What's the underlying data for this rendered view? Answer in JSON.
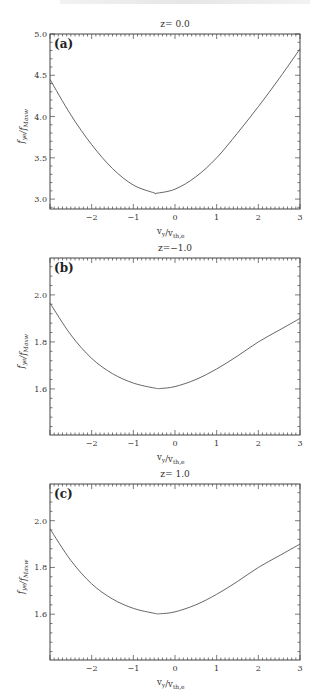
{
  "chart_data": [
    {
      "type": "line",
      "panel_label": "(a)",
      "title": "z= 0.0",
      "xlabel": "v_y/v_th,e",
      "ylabel": "f_ye/f_Maxw",
      "xlim": [
        -3,
        3
      ],
      "ylim": [
        2.88,
        5.0
      ],
      "xticks": [
        -2,
        -1,
        0,
        1,
        2,
        3
      ],
      "xtick_labels": [
        "−2",
        "−1",
        "0",
        "1",
        "2",
        "3"
      ],
      "yticks": [
        3.0,
        3.5,
        4.0,
        4.5,
        5.0
      ],
      "ytick_labels": [
        "3.0",
        "3.5",
        "4.0",
        "4.5",
        "5.0"
      ],
      "grid": false,
      "x": [
        -3.0,
        -2.5,
        -2.0,
        -1.5,
        -1.0,
        -0.5,
        -0.45,
        0.0,
        0.5,
        1.0,
        1.5,
        2.0,
        2.5,
        3.0
      ],
      "series": [
        {
          "name": "f_ye/f_Maxw",
          "values": [
            4.45,
            4.02,
            3.66,
            3.37,
            3.17,
            3.075,
            3.07,
            3.12,
            3.27,
            3.5,
            3.8,
            4.12,
            4.46,
            4.82
          ]
        }
      ]
    },
    {
      "type": "line",
      "panel_label": "(b)",
      "title": "z=−1.0",
      "xlabel": "v_y/v_th,e",
      "ylabel": "f_ye/f_Maxw",
      "xlim": [
        -3,
        3
      ],
      "ylim": [
        1.404,
        2.157
      ],
      "xticks": [
        -2,
        -1,
        0,
        1,
        2,
        3
      ],
      "xtick_labels": [
        "−2",
        "−1",
        "0",
        "1",
        "2",
        "3"
      ],
      "yticks": [
        1.6,
        1.8,
        2.0
      ],
      "ytick_labels": [
        "1.6",
        "1.8",
        "2.0"
      ],
      "grid": false,
      "x": [
        -3.0,
        -2.5,
        -2.0,
        -1.5,
        -1.0,
        -0.5,
        -0.35,
        0.0,
        0.5,
        1.0,
        1.5,
        2.0,
        2.5,
        3.0
      ],
      "series": [
        {
          "name": "f_ye/f_Maxw",
          "values": [
            1.965,
            1.83,
            1.73,
            1.665,
            1.625,
            1.604,
            1.602,
            1.61,
            1.64,
            1.685,
            1.74,
            1.8,
            1.85,
            1.9
          ]
        }
      ]
    },
    {
      "type": "line",
      "panel_label": "(c)",
      "title": "z= 1.0",
      "xlabel": "v_y/v_th,e",
      "ylabel": "f_ye/f_Maxw",
      "xlim": [
        -3,
        3
      ],
      "ylim": [
        1.404,
        2.157
      ],
      "xticks": [
        -2,
        -1,
        0,
        1,
        2,
        3
      ],
      "xtick_labels": [
        "−2",
        "−1",
        "0",
        "1",
        "2",
        "3"
      ],
      "yticks": [
        1.6,
        1.8,
        2.0
      ],
      "ytick_labels": [
        "1.6",
        "1.8",
        "2.0"
      ],
      "grid": false,
      "x": [
        -3.0,
        -2.5,
        -2.0,
        -1.5,
        -1.0,
        -0.5,
        -0.35,
        0.0,
        0.5,
        1.0,
        1.5,
        2.0,
        2.5,
        3.0
      ],
      "series": [
        {
          "name": "f_ye/f_Maxw",
          "values": [
            1.965,
            1.83,
            1.73,
            1.665,
            1.625,
            1.604,
            1.602,
            1.61,
            1.64,
            1.685,
            1.74,
            1.8,
            1.85,
            1.9
          ]
        }
      ]
    }
  ],
  "layout": {
    "plot_left": 50,
    "plot_right": 300,
    "panels": [
      {
        "top": 34,
        "bottom": 209,
        "title_y": 27
      },
      {
        "top": 258,
        "bottom": 435,
        "title_y": 251
      },
      {
        "top": 484,
        "bottom": 660,
        "title_y": 477
      }
    ],
    "line_color": "#555555",
    "axis_color": "#444444",
    "text_color": "#333333"
  }
}
